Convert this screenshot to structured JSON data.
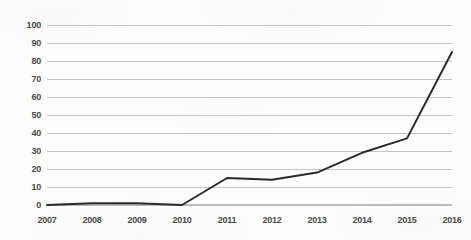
{
  "chart_data": {
    "type": "line",
    "title": "",
    "subtitle": "",
    "xlabel": "",
    "ylabel": "",
    "categories": [
      "2007",
      "2008",
      "2009",
      "2010",
      "2011",
      "2012",
      "2013",
      "2014",
      "2015",
      "2016"
    ],
    "values": [
      0,
      1,
      1,
      0,
      15,
      14,
      18,
      29,
      37,
      85
    ],
    "series": [
      {
        "name": "series-1",
        "values": [
          0,
          1,
          1,
          0,
          15,
          14,
          18,
          29,
          37,
          85
        ],
        "color": "#2b2b2b"
      }
    ],
    "ylim": [
      0,
      100
    ],
    "y_ticks": [
      0,
      10,
      20,
      30,
      40,
      50,
      60,
      70,
      80,
      90,
      100
    ],
    "y_tick_labels": [
      "0",
      "10",
      "20",
      "30",
      "40",
      "50",
      "60",
      "70",
      "80",
      "90",
      "100"
    ],
    "x_tick_labels": [
      "2007",
      "2008",
      "2009",
      "2010",
      "2011",
      "2012",
      "2013",
      "2014",
      "2015",
      "2016"
    ],
    "grid": true,
    "grid_axis": "y",
    "legend": false,
    "legend_position": "none",
    "annotations": []
  },
  "style": {
    "background_color": "#fdfdfd",
    "grid_color": "#b7b7b7",
    "axis_text_color": "#4a4a4a",
    "line_color": "#2b2b2b",
    "line_width": 2
  }
}
